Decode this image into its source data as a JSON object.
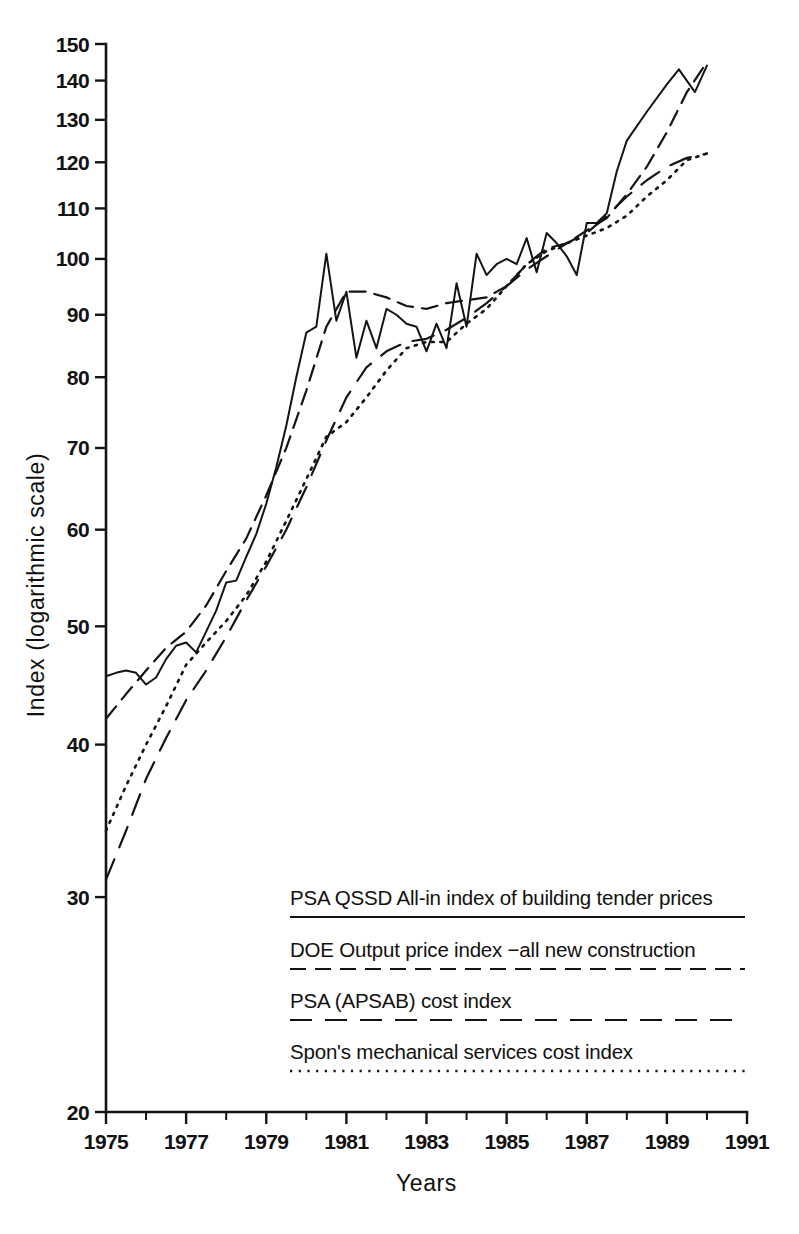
{
  "figure": {
    "background_color": "#ffffff",
    "ink_color": "#141414"
  },
  "chart_data": {
    "type": "line",
    "title": "",
    "subtitle": "",
    "xlabel": "Years",
    "ylabel": "Index (logarithmic scale)",
    "yscale": "log",
    "xscale": "linear",
    "grid": false,
    "xlim": [
      1975,
      1991
    ],
    "ylim": [
      20,
      150
    ],
    "legend_position": "inside-lower-right",
    "x_tick_labels": [
      "1975",
      "1977",
      "1979",
      "1981",
      "1983",
      "1985",
      "1987",
      "1989",
      "1991"
    ],
    "x_tick_values": [
      1975,
      1977,
      1979,
      1981,
      1983,
      1985,
      1987,
      1989,
      1991
    ],
    "x_minor_ticks": [
      1976,
      1978,
      1980,
      1982,
      1984,
      1986,
      1988,
      1990
    ],
    "y_tick_labels": [
      "20",
      "30",
      "40",
      "50",
      "60",
      "70",
      "80",
      "90",
      "100",
      "110",
      "120",
      "130",
      "140",
      "150"
    ],
    "y_tick_values": [
      20,
      30,
      40,
      50,
      60,
      70,
      80,
      90,
      100,
      110,
      120,
      130,
      140,
      150
    ],
    "series": [
      {
        "name": "PSA QSSD All-in index of building tender prices",
        "dash": "solid",
        "stroke_width": 2.0,
        "x": [
          1975.0,
          1975.25,
          1975.5,
          1975.75,
          1976.0,
          1976.25,
          1976.5,
          1976.75,
          1977.0,
          1977.25,
          1977.5,
          1977.75,
          1978.0,
          1978.25,
          1978.5,
          1978.75,
          1979.0,
          1979.25,
          1979.5,
          1979.75,
          1980.0,
          1980.25,
          1980.5,
          1980.75,
          1981.0,
          1981.25,
          1981.5,
          1981.75,
          1982.0,
          1982.25,
          1982.5,
          1982.75,
          1983.0,
          1983.25,
          1983.5,
          1983.75,
          1984.0,
          1984.25,
          1984.5,
          1984.75,
          1985.0,
          1985.25,
          1985.5,
          1985.75,
          1986.0,
          1986.25,
          1986.5,
          1986.75,
          1987.0,
          1987.25,
          1987.5,
          1987.75,
          1988.0,
          1988.5,
          1989.0,
          1989.3,
          1989.7,
          1990.0
        ],
        "values": [
          45.5,
          45.8,
          46.0,
          45.8,
          44.8,
          45.4,
          47.0,
          48.2,
          48.5,
          47.6,
          49.5,
          51.5,
          54.3,
          54.5,
          57.0,
          59.5,
          63.0,
          67.5,
          73.0,
          80.0,
          87.0,
          88.0,
          101.0,
          89.0,
          94.0,
          83.0,
          89.0,
          84.5,
          91.0,
          90.0,
          88.5,
          88.0,
          84.0,
          88.5,
          84.5,
          95.5,
          88.0,
          101.0,
          97.0,
          99.0,
          100.0,
          99.0,
          104.0,
          97.5,
          105.0,
          103.0,
          100.5,
          97.0,
          107.0,
          107.0,
          109.0,
          118.0,
          125.0,
          132.0,
          139.0,
          143.0,
          137.0,
          144.0
        ]
      },
      {
        "name": "DOE Output price index -all new construction",
        "dash": "medium-dash",
        "stroke_width": 2.2,
        "x": [
          1975.0,
          1975.5,
          1976.0,
          1976.5,
          1977.0,
          1977.5,
          1978.0,
          1978.5,
          1979.0,
          1979.5,
          1980.0,
          1980.5,
          1981.0,
          1981.5,
          1982.0,
          1982.5,
          1983.0,
          1983.5,
          1984.0,
          1984.5,
          1985.0,
          1985.5,
          1986.0,
          1986.5,
          1987.0,
          1987.5,
          1988.0,
          1988.5,
          1989.0,
          1989.5,
          1990.0
        ],
        "values": [
          42.0,
          44.0,
          46.0,
          48.0,
          49.5,
          52.0,
          55.5,
          59.0,
          64.0,
          70.0,
          78.0,
          88.0,
          94.0,
          94.0,
          93.0,
          91.5,
          91.0,
          92.0,
          92.5,
          93.0,
          95.0,
          99.0,
          102.0,
          103.0,
          105.5,
          108.0,
          113.0,
          119.0,
          127.0,
          137.0,
          145.0
        ]
      },
      {
        "name": "PSA (APSAB) cost index",
        "dash": "long-dash",
        "stroke_width": 2.2,
        "x": [
          1975.0,
          1975.5,
          1976.0,
          1976.5,
          1977.0,
          1977.5,
          1978.0,
          1978.5,
          1979.0,
          1979.5,
          1980.0,
          1980.5,
          1981.0,
          1981.5,
          1982.0,
          1982.5,
          1983.0,
          1983.5,
          1984.0,
          1984.5,
          1985.0,
          1985.5,
          1986.0,
          1986.5,
          1987.0,
          1987.5,
          1988.0,
          1988.5,
          1989.0,
          1989.5,
          1990.0
        ],
        "values": [
          31.0,
          34.0,
          37.5,
          40.5,
          43.5,
          46.0,
          49.0,
          52.5,
          56.0,
          60.0,
          65.0,
          71.0,
          77.0,
          81.5,
          84.0,
          85.5,
          86.0,
          87.5,
          89.5,
          92.0,
          95.0,
          98.0,
          100.5,
          103.0,
          105.0,
          108.5,
          112.5,
          116.0,
          119.0,
          121.0,
          122.0
        ]
      },
      {
        "name": "Spon's mechanical services cost index",
        "dash": "dotted",
        "stroke_width": 2.6,
        "x": [
          1975.0,
          1975.5,
          1976.0,
          1976.5,
          1977.0,
          1977.5,
          1978.0,
          1978.5,
          1979.0,
          1979.5,
          1980.0,
          1980.5,
          1981.0,
          1981.5,
          1982.0,
          1982.5,
          1983.0,
          1983.5,
          1984.0,
          1984.5,
          1985.0,
          1985.5,
          1986.0,
          1986.5,
          1987.0,
          1987.5,
          1988.0,
          1988.5,
          1989.0,
          1989.5,
          1990.0
        ],
        "values": [
          34.0,
          37.0,
          40.0,
          43.0,
          46.5,
          48.5,
          50.5,
          53.0,
          56.5,
          61.0,
          66.0,
          71.5,
          73.5,
          77.0,
          81.0,
          84.5,
          85.5,
          85.5,
          88.5,
          91.0,
          95.0,
          99.0,
          101.5,
          103.0,
          104.5,
          106.0,
          108.5,
          112.5,
          116.0,
          120.5,
          122.0
        ]
      }
    ]
  },
  "legend": {
    "entries": [
      {
        "label": "PSA QSSD All-in index of building tender prices",
        "dash": "solid"
      },
      {
        "label": "DOE Output price index −all new construction",
        "dash": "medium-dash"
      },
      {
        "label": "PSA (APSAB) cost index",
        "dash": "long-dash"
      },
      {
        "label": "Spon's mechanical services cost index",
        "dash": "dotted"
      }
    ]
  }
}
